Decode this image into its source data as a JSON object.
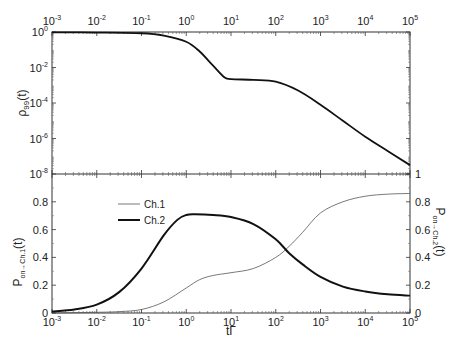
{
  "chart_data": [
    {
      "panel": "top",
      "type": "line",
      "xscale": "log",
      "yscale": "log",
      "xlim": [
        0.001,
        100000
      ],
      "ylim": [
        1e-08,
        1
      ],
      "xticks": [
        "10^-3",
        "10^-2",
        "10^-1",
        "10^0",
        "10^1",
        "10^2",
        "10^3",
        "10^4",
        "10^5"
      ],
      "yticks": [
        "10^0",
        "10^-2",
        "10^-4",
        "10^-6",
        "10^-8"
      ],
      "ylabel": "ρ99(t)",
      "xaxis_position": "top",
      "series": [
        {
          "name": "ρ99(t)",
          "style": "thick",
          "x_log10": [
            -3,
            -2,
            -1,
            -0.5,
            0,
            0.3,
            0.6,
            0.85,
            1.0,
            1.5,
            2.0,
            2.5,
            3.0,
            3.5,
            4.0,
            4.5,
            5.0
          ],
          "y_log10": [
            -0.02,
            -0.03,
            -0.07,
            -0.2,
            -0.55,
            -1.1,
            -1.9,
            -2.55,
            -2.65,
            -2.7,
            -2.8,
            -3.3,
            -4.1,
            -5.0,
            -5.9,
            -6.7,
            -7.5
          ]
        }
      ]
    },
    {
      "panel": "bottom",
      "type": "line",
      "xscale": "log",
      "xlim": [
        0.001,
        100000
      ],
      "ylim": [
        0,
        1
      ],
      "xlabel": "tΓ",
      "ylabel_left": "P_on→Ch.1(t)",
      "ylabel_right": "P_on→Ch.2(t)",
      "xticks": [
        "10^-3",
        "10^-2",
        "10^-1",
        "10^0",
        "10^1",
        "10^2",
        "10^3",
        "10^4",
        "10^5"
      ],
      "yticks_left": [
        "0",
        "0.2",
        "0.4",
        "0.6",
        "0.8"
      ],
      "yticks_right": [
        "0",
        "0.2",
        "0.4",
        "0.6",
        "0.8",
        "1"
      ],
      "legend": [
        "Ch.1",
        "Ch.2"
      ],
      "legend_position": "upper-left",
      "series": [
        {
          "name": "Ch.1",
          "style": "thin",
          "x_log10": [
            -3,
            -2,
            -1.5,
            -1,
            -0.5,
            0,
            0.3,
            0.6,
            1.0,
            1.5,
            2.0,
            2.3,
            2.6,
            3.0,
            3.5,
            4.0,
            4.5,
            5.0
          ],
          "values": [
            0.0,
            0.005,
            0.01,
            0.025,
            0.08,
            0.18,
            0.24,
            0.27,
            0.29,
            0.32,
            0.4,
            0.48,
            0.58,
            0.72,
            0.8,
            0.84,
            0.855,
            0.86
          ]
        },
        {
          "name": "Ch.2",
          "style": "thick",
          "x_log10": [
            -3,
            -2.5,
            -2,
            -1.5,
            -1,
            -0.5,
            -0.2,
            0,
            0.2,
            0.6,
            1.0,
            1.5,
            2.0,
            2.3,
            2.6,
            3.0,
            3.5,
            4.0,
            4.5,
            5.0
          ],
          "values": [
            0.01,
            0.025,
            0.06,
            0.15,
            0.32,
            0.56,
            0.67,
            0.705,
            0.71,
            0.705,
            0.69,
            0.64,
            0.53,
            0.43,
            0.35,
            0.26,
            0.19,
            0.155,
            0.135,
            0.125
          ]
        }
      ]
    }
  ],
  "labels": {
    "top_ylabel_main": "ρ",
    "top_ylabel_sub": "99",
    "top_ylabel_tail": "(t)",
    "bottom_left_ylabel_main": "P",
    "bottom_left_ylabel_sub": "on→Ch.1",
    "bottom_left_ylabel_tail": "(t)",
    "bottom_right_ylabel_main": "P",
    "bottom_right_ylabel_sub": "on→Ch.2",
    "bottom_right_ylabel_tail": "(t)",
    "xlabel": "tΓ",
    "legend_ch1": "Ch.1",
    "legend_ch2": "Ch.2"
  }
}
